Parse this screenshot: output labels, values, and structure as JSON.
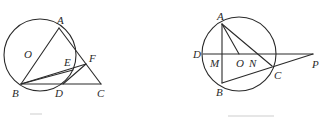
{
  "figures": [
    {
      "id": "figure-1",
      "points": {
        "A": {
          "label": "A",
          "x": 59,
          "y": 28
        },
        "B": {
          "label": "B",
          "x": 21,
          "y": 84
        },
        "C": {
          "label": "C",
          "x": 101,
          "y": 84
        },
        "D": {
          "label": "D",
          "x": 63,
          "y": 84
        },
        "E": {
          "label": "E",
          "x": 72,
          "y": 68
        },
        "F": {
          "label": "F",
          "x": 86,
          "y": 64
        },
        "O": {
          "label": "O",
          "x": 40,
          "y": 56
        }
      },
      "circle": {
        "cx": 40,
        "cy": 55,
        "r": 36
      },
      "segments": [
        "AB",
        "AC",
        "BC",
        "BF",
        "BE",
        "DF"
      ]
    },
    {
      "id": "figure-2",
      "points": {
        "A": {
          "label": "A",
          "x": 222,
          "y": 24
        },
        "B": {
          "label": "B",
          "x": 222,
          "y": 83
        },
        "C": {
          "label": "C",
          "x": 272,
          "y": 66
        },
        "D": {
          "label": "D",
          "x": 203,
          "y": 54
        },
        "M": {
          "label": "M",
          "x": 222,
          "y": 54
        },
        "O": {
          "label": "O",
          "x": 239,
          "y": 54
        },
        "N": {
          "label": "N",
          "x": 257,
          "y": 54
        },
        "P": {
          "label": "P",
          "x": 313,
          "y": 54
        }
      },
      "circle": {
        "cx": 239,
        "cy": 54,
        "r": 37
      },
      "segments": [
        "AB",
        "AO",
        "AC",
        "DP",
        "BP"
      ]
    }
  ]
}
